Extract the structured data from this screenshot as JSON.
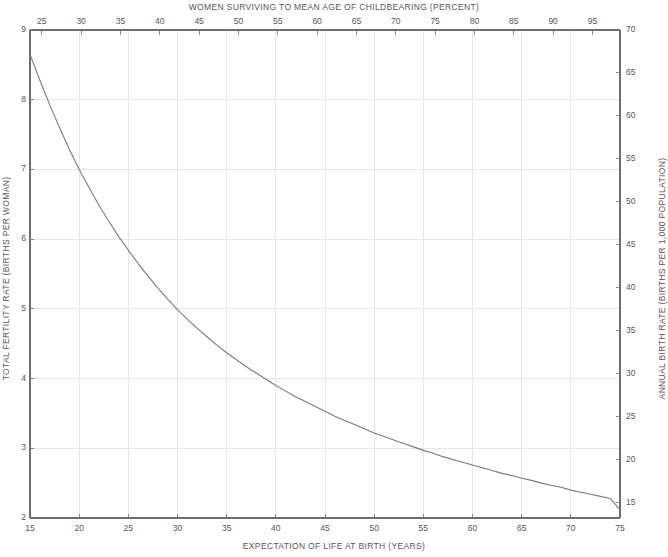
{
  "chart_data": {
    "type": "line",
    "title": "",
    "xlabel": "EXPECTATION OF LIFE AT BIRTH (YEARS)",
    "ylabel": "TOTAL FERTILITY RATE (BIRTHS PER WOMAN)",
    "top_axis_label": "WOMEN SURVIVING TO MEAN AGE OF CHILDBEARING (PERCENT)",
    "right_axis_label": "ANNUAL BIRTH RATE (BIRTHS PER 1,000 POPULATION)",
    "xlim": [
      15,
      75
    ],
    "ylim": [
      2,
      9
    ],
    "top_xlim": [
      23.5,
      98.5
    ],
    "right_ylim": [
      13.2,
      70
    ],
    "grid": true,
    "legend": null,
    "xticks": [
      15,
      20,
      25,
      30,
      35,
      40,
      45,
      50,
      55,
      60,
      65,
      70,
      75
    ],
    "yticks": [
      2,
      3,
      4,
      5,
      6,
      7,
      8,
      9
    ],
    "top_xticks": [
      25,
      30,
      35,
      40,
      45,
      50,
      55,
      60,
      65,
      70,
      75,
      80,
      85,
      90,
      95
    ],
    "right_yticks": [
      15,
      20,
      25,
      30,
      35,
      40,
      45,
      50,
      55,
      60,
      65,
      70
    ],
    "series": [
      {
        "name": "fertility-vs-life-expectancy",
        "color": "#7a7a7a",
        "x": [
          15,
          16,
          17,
          18,
          19,
          20,
          21,
          22,
          23,
          24,
          25,
          26,
          27,
          28,
          29,
          30,
          31,
          32,
          33,
          34,
          35,
          36,
          37,
          38,
          39,
          40,
          41,
          42,
          43,
          44,
          45,
          46,
          47,
          48,
          49,
          50,
          51,
          52,
          53,
          54,
          55,
          56,
          57,
          58,
          59,
          60,
          61,
          62,
          63,
          64,
          65,
          66,
          67,
          68,
          69,
          70,
          71,
          72,
          73,
          74,
          75
        ],
        "y": [
          8.65,
          8.28,
          7.93,
          7.6,
          7.29,
          7.0,
          6.74,
          6.49,
          6.26,
          6.04,
          5.84,
          5.65,
          5.47,
          5.3,
          5.14,
          4.99,
          4.85,
          4.72,
          4.6,
          4.48,
          4.37,
          4.27,
          4.17,
          4.08,
          3.99,
          3.9,
          3.82,
          3.74,
          3.67,
          3.6,
          3.53,
          3.46,
          3.4,
          3.34,
          3.28,
          3.22,
          3.17,
          3.12,
          3.07,
          3.02,
          2.97,
          2.93,
          2.88,
          2.84,
          2.8,
          2.76,
          2.72,
          2.68,
          2.64,
          2.61,
          2.57,
          2.54,
          2.5,
          2.47,
          2.44,
          2.4,
          2.37,
          2.34,
          2.31,
          2.28,
          2.12
        ]
      }
    ]
  },
  "styling": {
    "axis_color": "#6e6e6e",
    "grid_color": "#e6e6e6",
    "text_color": "#555555",
    "background": "#ffffff"
  }
}
